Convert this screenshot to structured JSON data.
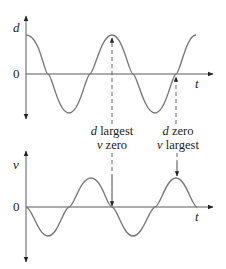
{
  "diagram": {
    "title": "",
    "top_graph": {
      "y_label": "d",
      "origin_label": "0",
      "x_label": "t",
      "curve": "cosine",
      "description": "displacement vs time"
    },
    "bottom_graph": {
      "y_label": "v",
      "origin_label": "0",
      "x_label": "t",
      "curve": "negative sine",
      "description": "velocity vs time"
    },
    "annotations": [
      {
        "line1_var": "d",
        "line1_text": " largest",
        "line2_var": "v",
        "line2_text": " zero"
      },
      {
        "line1_var": "d",
        "line1_text": " zero",
        "line2_var": "v",
        "line2_text": " largest"
      }
    ],
    "colors": {
      "curve": "#7a7a7a",
      "axis": "#5a5a5a",
      "text": "#222222"
    }
  }
}
